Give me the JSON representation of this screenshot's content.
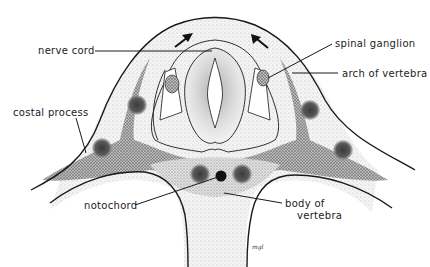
{
  "diagram": {
    "type": "anatomical cross-section",
    "colors": {
      "outline": "#1a1a1a",
      "light_stipple": "#e9e9e9",
      "medium_stipple": "#cfcfcf",
      "dark_stipple": "#9a9a9a",
      "condensation": "#555555",
      "notochord": "#111111"
    },
    "labels": {
      "nerve_cord": "nerve cord",
      "spinal_ganglion": "spinal ganglion",
      "arch_of_vertebra": "arch of vertebra",
      "costal_process": "costal process",
      "notochord": "notochord",
      "body_of_vertebra_line1": "body of",
      "body_of_vertebra_line2": "vertebra"
    },
    "signature": "mgl",
    "arrows": [
      "arrow-up-right",
      "arrow-up-left"
    ]
  }
}
